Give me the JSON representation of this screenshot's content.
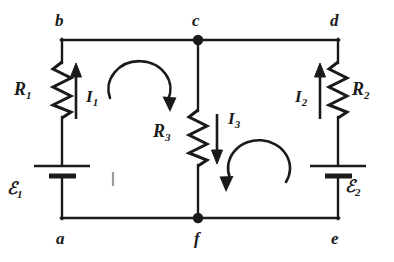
{
  "figure": {
    "kind": "circuit-diagram",
    "background_color": "#ffffff",
    "line_color": "#1a1a1a"
  },
  "nodes": [
    {
      "id": "b",
      "label": "b",
      "x": 62,
      "y": 40,
      "label_x": 55,
      "label_y": 12,
      "junction_dot": false
    },
    {
      "id": "c",
      "label": "c",
      "x": 198,
      "y": 40,
      "label_x": 192,
      "label_y": 12,
      "junction_dot": true
    },
    {
      "id": "d",
      "label": "d",
      "x": 338,
      "y": 40,
      "label_x": 330,
      "label_y": 12,
      "junction_dot": false
    },
    {
      "id": "a",
      "label": "a",
      "x": 62,
      "y": 218,
      "label_x": 56,
      "label_y": 230,
      "junction_dot": false
    },
    {
      "id": "f",
      "label": "f",
      "x": 198,
      "y": 218,
      "label_x": 194,
      "label_y": 230,
      "junction_dot": true
    },
    {
      "id": "e",
      "label": "e",
      "x": 338,
      "y": 218,
      "label_x": 331,
      "label_y": 230,
      "junction_dot": false
    }
  ],
  "resistors": [
    {
      "id": "R1",
      "symbol": "R",
      "subscript": "1",
      "branch": "left",
      "label_x": 14,
      "label_y": 80,
      "x": 62,
      "y_top": 62,
      "y_bottom": 118
    },
    {
      "id": "R3",
      "symbol": "R",
      "subscript": "3",
      "branch": "middle",
      "label_x": 155,
      "label_y": 122,
      "x": 198,
      "y_top": 110,
      "y_bottom": 166
    },
    {
      "id": "R2",
      "symbol": "R",
      "subscript": "2",
      "branch": "right",
      "label_x": 350,
      "label_y": 80,
      "x": 338,
      "y_top": 62,
      "y_bottom": 118
    }
  ],
  "batteries": [
    {
      "id": "emf1",
      "symbol": "ℰ",
      "subscript": "1",
      "branch": "left",
      "label_x": 8,
      "label_y": 180,
      "x": 62,
      "y": 172
    },
    {
      "id": "emf2",
      "symbol": "ℰ",
      "subscript": "2",
      "branch": "right",
      "label_x": 345,
      "label_y": 178,
      "x": 338,
      "y": 172
    }
  ],
  "currents": [
    {
      "id": "I1",
      "symbol": "I",
      "subscript": "1",
      "direction": "up",
      "label_x": 88,
      "label_y": 85,
      "arrow_x": 76,
      "arrow_y_tail": 118,
      "arrow_y_head": 68
    },
    {
      "id": "I3",
      "symbol": "I",
      "subscript": "3",
      "direction": "down",
      "label_x": 228,
      "label_y": 112,
      "arrow_x": 217,
      "arrow_y_tail": 118,
      "arrow_y_head": 160
    },
    {
      "id": "I2",
      "symbol": "I",
      "subscript": "2",
      "direction": "up",
      "label_x": 296,
      "label_y": 88,
      "arrow_x": 320,
      "arrow_y_tail": 118,
      "arrow_y_head": 68
    }
  ],
  "loop_arrows": [
    {
      "id": "loop-left",
      "direction": "clockwise",
      "center_x": 140,
      "center_y": 88,
      "radius": 30
    },
    {
      "id": "loop-right",
      "direction": "counterclockwise",
      "center_x": 257,
      "center_y": 168,
      "radius": 30
    }
  ],
  "artifacts": [
    {
      "id": "tick-mark",
      "x": 112,
      "y": 172,
      "width": 2,
      "height": 14
    }
  ]
}
